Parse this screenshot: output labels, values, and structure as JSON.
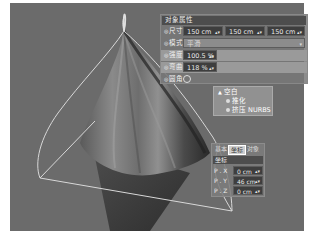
{
  "viewport": {
    "background": "#6b6b6b",
    "object": "cone-cloth-mesh"
  },
  "attributes_panel": {
    "title": "对象属性",
    "rows": [
      {
        "label": "尺寸",
        "values": [
          "150 cm",
          "150 cm",
          "150 cm"
        ]
      },
      {
        "label": "模式",
        "value": "平滑"
      },
      {
        "label": "强度",
        "value": "100.5 %"
      },
      {
        "label": "弯曲",
        "value": "118 %"
      },
      {
        "label": "圆角",
        "checkbox": true
      }
    ]
  },
  "object_tree": {
    "items": [
      {
        "label": "空白",
        "level": 0
      },
      {
        "label": "推化",
        "level": 1
      },
      {
        "label": "挤压 NURBS",
        "level": 1
      }
    ]
  },
  "coord_panel": {
    "tabs": [
      {
        "label": "基本",
        "active": false
      },
      {
        "label": "坐标",
        "active": true
      },
      {
        "label": "对象",
        "active": false
      }
    ],
    "header": "坐标",
    "rows": [
      {
        "label": "P . X",
        "value": "0 cm"
      },
      {
        "label": "P . Y",
        "value": "46 cm"
      },
      {
        "label": "P . Z",
        "value": "0 cm"
      }
    ]
  },
  "icons": {
    "spinner": "▴▾",
    "dropdown_arrow": "▾",
    "radio": "◎"
  }
}
